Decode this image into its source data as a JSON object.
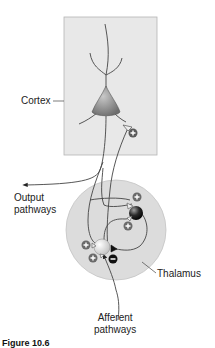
{
  "diagram": {
    "type": "neural-circuit",
    "regions": [
      {
        "id": "cortex",
        "label": "Cortex",
        "shape": "rectangle",
        "fill": "#e6e6e6"
      },
      {
        "id": "thalamus",
        "label": "Thalamus",
        "shape": "circle",
        "fill": "#dcdcdc"
      }
    ],
    "neurons": [
      {
        "id": "cortical-pyramidal",
        "region": "cortex",
        "color": "#8a8a8a"
      },
      {
        "id": "thalamic-relay",
        "region": "thalamus",
        "color": "#e0e0e0"
      },
      {
        "id": "thalamic-interneuron",
        "region": "thalamus",
        "color": "#1a1a1a"
      }
    ],
    "synapse_signs": {
      "excitatory": "+",
      "inhibitory": "−"
    },
    "labels": {
      "cortex": "Cortex",
      "output": [
        "Output",
        "pathways"
      ],
      "thalamus": "Thalamus",
      "afferent": [
        "Afferent",
        "pathways"
      ]
    },
    "caption": "Figure 10.6"
  }
}
